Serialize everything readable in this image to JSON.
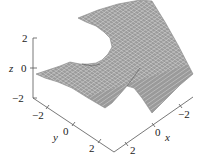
{
  "chart_data": {
    "type": "surface3d",
    "title": "",
    "surface_color": "#9a9a9a",
    "mesh_color": "#e2e2e2",
    "axes": {
      "x": {
        "label": "x",
        "range": [
          -3,
          3
        ],
        "ticks": [
          2,
          0,
          -2
        ],
        "tick_labels": [
          "2",
          "0",
          "−2"
        ]
      },
      "y": {
        "label": "y",
        "range": [
          -3,
          3
        ],
        "ticks": [
          -2,
          0,
          2
        ],
        "tick_labels": [
          "−2",
          "0",
          "2"
        ]
      },
      "z": {
        "label": "z",
        "range": [
          -2,
          2
        ],
        "ticks": [
          2,
          0,
          -2
        ],
        "tick_labels": [
          "2",
          "0",
          "−2"
        ]
      }
    }
  }
}
